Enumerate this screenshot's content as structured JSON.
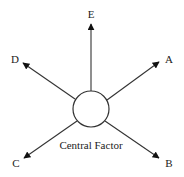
{
  "diagram": {
    "center": {
      "label": "Central Factor",
      "cx": 91,
      "cy": 109,
      "r": 18
    },
    "colors": {
      "stroke": "#333333",
      "text": "#222222",
      "background": "#ffffff"
    },
    "arrows": [
      {
        "id": "E",
        "label": "E",
        "x1": 91,
        "y1": 91,
        "x2": 91,
        "y2": 24,
        "lx": 91,
        "ly": 18
      },
      {
        "id": "A",
        "label": "A",
        "x1": 107,
        "y1": 100,
        "x2": 159,
        "y2": 62,
        "lx": 169,
        "ly": 63
      },
      {
        "id": "D",
        "label": "D",
        "x1": 75,
        "y1": 99,
        "x2": 23,
        "y2": 63,
        "lx": 15,
        "ly": 63
      },
      {
        "id": "C",
        "label": "C",
        "x1": 77,
        "y1": 121,
        "x2": 24,
        "y2": 158,
        "lx": 16,
        "ly": 167
      },
      {
        "id": "B",
        "label": "B",
        "x1": 105,
        "y1": 121,
        "x2": 159,
        "y2": 158,
        "lx": 169,
        "ly": 167
      }
    ]
  }
}
